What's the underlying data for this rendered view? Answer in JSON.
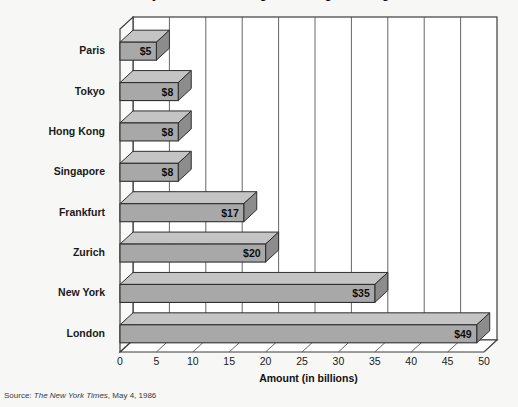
{
  "chart_data": {
    "type": "bar",
    "orientation": "horizontal",
    "style": "3d-isometric",
    "title": "Daily Volume of Foreign Exchange Trading",
    "xlabel": "Amount (in billions)",
    "ylabel": "",
    "categories": [
      "Paris",
      "Tokyo",
      "Hong Kong",
      "Singapore",
      "Frankfurt",
      "Zurich",
      "New York",
      "London"
    ],
    "values": [
      5,
      8,
      8,
      8,
      17,
      20,
      35,
      49
    ],
    "value_labels": [
      "$5",
      "$8",
      "$8",
      "$8",
      "$17",
      "$20",
      "$35",
      "$49"
    ],
    "xlim": [
      0,
      50
    ],
    "xticks": [
      0,
      5,
      10,
      15,
      20,
      25,
      30,
      35,
      40,
      45,
      50
    ],
    "xtick_labels": [
      "0",
      "5",
      "10",
      "15",
      "20",
      "25",
      "30",
      "35",
      "40",
      "45",
      "50"
    ],
    "grid": "vertical",
    "legend": null,
    "bar_face_color": "#a8a8a8",
    "bar_shade_color": "#8c8c8c",
    "bar_top_color": "#c4c4c4",
    "plot_bg_color": "#ffffff",
    "page_bg_color": "#f7f7f5",
    "axis_color": "#4a4a4a",
    "text_color": "#1a1a1a"
  },
  "source": {
    "prefix": "Source:",
    "publication": "The New York Times",
    "suffix": ", May 4, 1986",
    "full": "Source: The New York Times, May 4, 1986"
  }
}
